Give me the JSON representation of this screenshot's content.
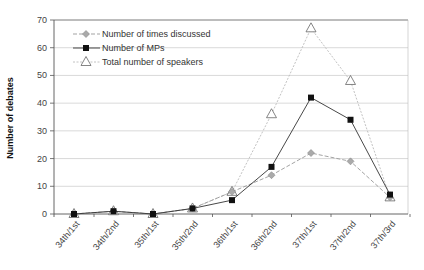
{
  "chart_data": {
    "type": "line",
    "title": "",
    "xlabel": "",
    "ylabel": "Number of debates",
    "ylim": [
      0,
      70
    ],
    "yticks": [
      0,
      10,
      20,
      30,
      40,
      50,
      60,
      70
    ],
    "grid": true,
    "legend_position": "top-left",
    "categories": [
      "34th/1st",
      "34th/2nd",
      "35th/1st",
      "35th/2nd",
      "36th/1st",
      "36th/2nd",
      "37th/1st",
      "37th/2nd",
      "37th/3rd"
    ],
    "series": [
      {
        "name": "Number of times discussed",
        "marker": "diamond",
        "line": "dashed",
        "color": "#999999",
        "values": [
          0,
          1,
          0,
          2,
          8,
          14,
          22,
          19,
          6
        ]
      },
      {
        "name": "Number of MPs",
        "marker": "square",
        "line": "solid",
        "color": "#111111",
        "values": [
          0,
          1,
          0,
          2,
          5,
          17,
          42,
          34,
          7
        ]
      },
      {
        "name": "Total number of speakers",
        "marker": "triangle",
        "line": "dotted",
        "color": "#aaaaaa",
        "values": [
          0,
          1,
          0,
          2,
          8,
          36,
          67,
          48,
          6
        ]
      }
    ]
  }
}
